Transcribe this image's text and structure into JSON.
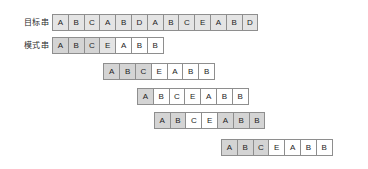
{
  "diagram": {
    "geometry": {
      "cell_width": 16.8,
      "cell_height": 17,
      "row_spacing": 23,
      "origin_x": 53,
      "origin_y": 14
    },
    "colors": {
      "shaded": "#d4d4d4",
      "faint": "#e4e4e4",
      "cell_bg": "#ffffff",
      "border": "#8e8e8e",
      "text": "#1c1c1c",
      "label_text": "#2b2b2b"
    },
    "rows": [
      {
        "name": "target-string-row",
        "label": "目标串",
        "offset": 0,
        "top": 14,
        "cells": [
          {
            "char": "A",
            "shade": "faint"
          },
          {
            "char": "B",
            "shade": "faint"
          },
          {
            "char": "C",
            "shade": "faint"
          },
          {
            "char": "A",
            "shade": "faint"
          },
          {
            "char": "B",
            "shade": "faint"
          },
          {
            "char": "D",
            "shade": "faint"
          },
          {
            "char": "A",
            "shade": "faint"
          },
          {
            "char": "B",
            "shade": "faint"
          },
          {
            "char": "C",
            "shade": "faint"
          },
          {
            "char": "E",
            "shade": "faint"
          },
          {
            "char": "A",
            "shade": "faint"
          },
          {
            "char": "B",
            "shade": "faint"
          },
          {
            "char": "D",
            "shade": "faint"
          }
        ]
      },
      {
        "name": "pattern-row-1",
        "label": "模式串",
        "offset": 0,
        "top": 37,
        "cells": [
          {
            "char": "A",
            "shade": "shaded"
          },
          {
            "char": "B",
            "shade": "shaded"
          },
          {
            "char": "C",
            "shade": "shaded"
          },
          {
            "char": "E",
            "shade": "faint"
          },
          {
            "char": "A",
            "shade": "none"
          },
          {
            "char": "B",
            "shade": "none"
          },
          {
            "char": "B",
            "shade": "none"
          }
        ]
      },
      {
        "name": "pattern-row-2",
        "label": "",
        "offset": 3,
        "top": 63,
        "cells": [
          {
            "char": "A",
            "shade": "shaded"
          },
          {
            "char": "B",
            "shade": "shaded"
          },
          {
            "char": "C",
            "shade": "shaded"
          },
          {
            "char": "E",
            "shade": "none"
          },
          {
            "char": "A",
            "shade": "none"
          },
          {
            "char": "B",
            "shade": "none"
          },
          {
            "char": "B",
            "shade": "none"
          }
        ]
      },
      {
        "name": "pattern-row-3",
        "label": "",
        "offset": 5,
        "top": 88,
        "cells": [
          {
            "char": "A",
            "shade": "shaded"
          },
          {
            "char": "B",
            "shade": "none"
          },
          {
            "char": "C",
            "shade": "none"
          },
          {
            "char": "E",
            "shade": "none"
          },
          {
            "char": "A",
            "shade": "none"
          },
          {
            "char": "B",
            "shade": "none"
          },
          {
            "char": "B",
            "shade": "none"
          }
        ]
      },
      {
        "name": "pattern-row-4",
        "label": "",
        "offset": 6,
        "top": 112,
        "cells": [
          {
            "char": "A",
            "shade": "shaded"
          },
          {
            "char": "B",
            "shade": "shaded"
          },
          {
            "char": "C",
            "shade": "none"
          },
          {
            "char": "E",
            "shade": "none"
          },
          {
            "char": "A",
            "shade": "shaded"
          },
          {
            "char": "B",
            "shade": "shaded"
          },
          {
            "char": "B",
            "shade": "shaded"
          }
        ]
      },
      {
        "name": "pattern-row-5",
        "label": "",
        "offset": 10,
        "top": 139,
        "cells": [
          {
            "char": "A",
            "shade": "shaded"
          },
          {
            "char": "B",
            "shade": "shaded"
          },
          {
            "char": "C",
            "shade": "shaded"
          },
          {
            "char": "E",
            "shade": "none"
          },
          {
            "char": "A",
            "shade": "none"
          },
          {
            "char": "B",
            "shade": "none"
          },
          {
            "char": "B",
            "shade": "none"
          }
        ]
      }
    ]
  }
}
